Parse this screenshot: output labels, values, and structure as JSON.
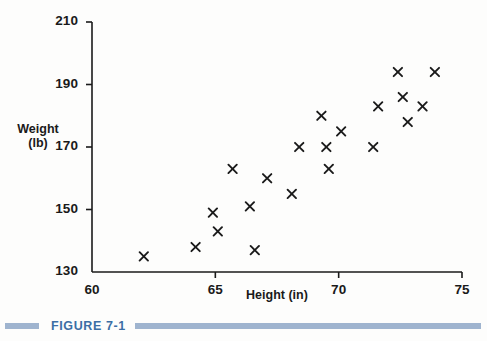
{
  "figure": {
    "caption_label": "FIGURE 7-1",
    "accent_color": "#3b6ea5",
    "rule_color": "#9fb4cf"
  },
  "chart_data": {
    "type": "scatter",
    "title": "",
    "subtitle": "",
    "xlabel": "Height (in)",
    "ylabel_line1": "Weight",
    "ylabel_line2": "(lb)",
    "ylabel": "Weight (lb)",
    "xlim": [
      60,
      75
    ],
    "ylim": [
      130,
      210
    ],
    "xticks": [
      60,
      65,
      70,
      75
    ],
    "yticks": [
      130,
      150,
      170,
      190,
      210
    ],
    "xtick_labels": [
      "60",
      "65",
      "70",
      "75"
    ],
    "ytick_labels": [
      "130",
      "150",
      "170",
      "190",
      "210"
    ],
    "grid": false,
    "legend": null,
    "marker": "x",
    "marker_color": "#1a1a1a",
    "axis_color": "#1a1a1a",
    "series": [
      {
        "name": "Height vs Weight",
        "x": [
          62.1,
          64.2,
          64.9,
          65.1,
          65.7,
          66.4,
          66.6,
          67.1,
          68.1,
          68.4,
          69.3,
          69.5,
          69.6,
          70.1,
          71.4,
          71.6,
          72.4,
          72.6,
          72.8,
          73.4,
          73.9
        ],
        "y": [
          135,
          138,
          149,
          143,
          163,
          151,
          137,
          160,
          155,
          170,
          180,
          170,
          163,
          175,
          170,
          183,
          194,
          186,
          178,
          183,
          194
        ]
      }
    ],
    "points": [
      {
        "height": 62.1,
        "weight": 135
      },
      {
        "height": 64.2,
        "weight": 138
      },
      {
        "height": 64.9,
        "weight": 149
      },
      {
        "height": 65.1,
        "weight": 143
      },
      {
        "height": 65.7,
        "weight": 163
      },
      {
        "height": 66.4,
        "weight": 151
      },
      {
        "height": 66.6,
        "weight": 137
      },
      {
        "height": 67.1,
        "weight": 160
      },
      {
        "height": 68.1,
        "weight": 155
      },
      {
        "height": 68.4,
        "weight": 170
      },
      {
        "height": 69.3,
        "weight": 180
      },
      {
        "height": 69.5,
        "weight": 170
      },
      {
        "height": 69.6,
        "weight": 163
      },
      {
        "height": 70.1,
        "weight": 175
      },
      {
        "height": 71.4,
        "weight": 170
      },
      {
        "height": 71.6,
        "weight": 183
      },
      {
        "height": 72.4,
        "weight": 194
      },
      {
        "height": 72.6,
        "weight": 186
      },
      {
        "height": 72.8,
        "weight": 178
      },
      {
        "height": 73.4,
        "weight": 183
      },
      {
        "height": 73.9,
        "weight": 194
      }
    ]
  }
}
